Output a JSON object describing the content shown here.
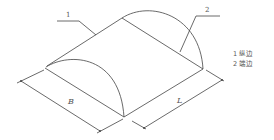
{
  "diagram": {
    "type": "isometric-drawing",
    "callouts": [
      {
        "number": "1",
        "target": "longitudinal edge"
      },
      {
        "number": "2",
        "target": "end edge"
      }
    ],
    "dimensions": [
      {
        "label": "B",
        "meaning": "width"
      },
      {
        "label": "L",
        "meaning": "length"
      }
    ],
    "legend": [
      {
        "text": "1 纵边"
      },
      {
        "text": "2 端边"
      }
    ],
    "colors": {
      "line": "#444444",
      "text": "#555555",
      "background": "#ffffff"
    }
  }
}
